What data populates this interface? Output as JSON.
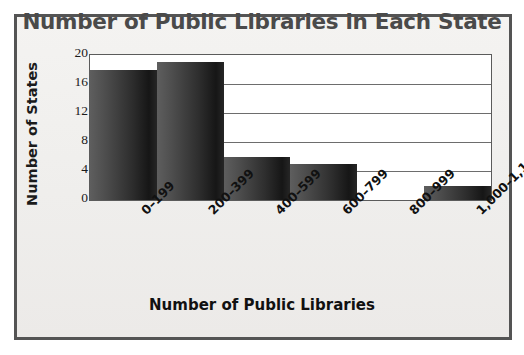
{
  "chart_data": {
    "type": "bar",
    "title": "Number of Public Libraries in Each State",
    "xlabel": "Number of Public Libraries",
    "ylabel": "Number of States",
    "categories": [
      "0–199",
      "200–399",
      "400–599",
      "600–799",
      "800–999",
      "1,000–1,199"
    ],
    "values": [
      18,
      19,
      6,
      5,
      0,
      2
    ],
    "ylim": [
      0,
      20
    ],
    "yticks": [
      20,
      16,
      12,
      8,
      4,
      0
    ],
    "ytick_labels": [
      "20",
      "16",
      "12",
      "8",
      "4",
      "0"
    ],
    "grid": true,
    "grid_axis": "y",
    "legend": false,
    "bar_gap": 0,
    "colors": {
      "bar_light": "#5e5e5e",
      "bar_dark": "#161616",
      "title": "#4a4a4a",
      "axis_text": "#1b1b1b",
      "plot_background": "#ffffff",
      "figure_background": "#f2f1ef",
      "frame_border": "#545454",
      "gridline": "#6d6d6d"
    }
  }
}
